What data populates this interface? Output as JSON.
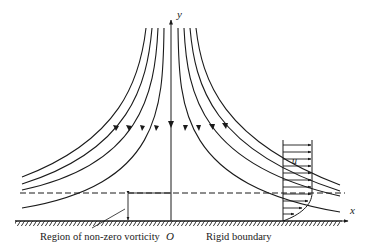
{
  "figure": {
    "axes": {
      "x_label": "x",
      "y_label": "y",
      "origin_label": "O"
    },
    "labels": {
      "region": "Region of non-zero vorticity",
      "boundary": "Rigid boundary",
      "velocity": "u"
    },
    "colors": {
      "ink": "#1a1a1a",
      "background": "#ffffff"
    }
  }
}
